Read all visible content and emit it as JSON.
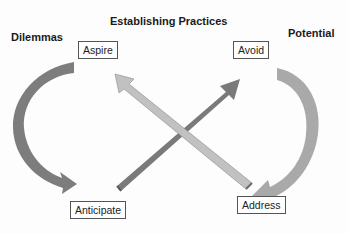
{
  "headings": {
    "left": "Dilemmas",
    "center": "Establishing Practices",
    "right": "Potential"
  },
  "boxes": {
    "aspire": "Aspire",
    "avoid": "Avoid",
    "anticipate": "Anticipate",
    "address": "Address"
  },
  "colors": {
    "dark_arrow": "#7a7a7a",
    "light_arrow": "#bdbdbd",
    "left_curve": "#7d7d7d",
    "right_curve": "#a9a9a9"
  }
}
